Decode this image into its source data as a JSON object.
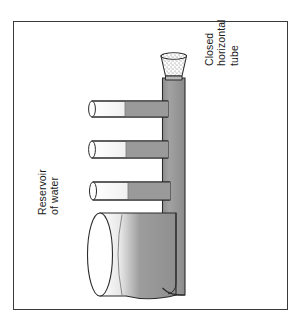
{
  "figure": {
    "kind": "physics-apparatus-diagram",
    "title_alt": "Closed horizontal tube connected to a reservoir of water",
    "frame": {
      "border_color": "#3a3a3a",
      "background": "#ffffff"
    }
  },
  "colors": {
    "water_fill": "#9a9a9a",
    "water_fill_dark": "#8c8c8c",
    "air_fill": "#ffffff",
    "outline": "#2b2b2b",
    "text": "#1a1a1a",
    "stipple": "#6e6e6e",
    "page_background": "#ffffff"
  },
  "labels": {
    "closed_tube": {
      "name": "closed-horizontal-tube-label",
      "lines": [
        "Closed",
        "horizontal",
        "tube"
      ],
      "line1": "Closed",
      "line2": "horizontal",
      "line3": "tube",
      "rotation_deg": -90
    },
    "reservoir": {
      "name": "reservoir-of-water-label",
      "lines": [
        "Reservoir",
        "of  water"
      ],
      "line1": "Reservoir",
      "line2": "of  water",
      "rotation_deg": -90
    }
  },
  "parts": {
    "funnel": {
      "name": "stippled-funnel",
      "description": "stippled trapezoidal funnel at top of vertical tube, wider at top"
    },
    "vertical_tube": {
      "name": "main-vertical-tube",
      "description": "water filled vertical column running down the right side"
    },
    "branch_tubes": [
      {
        "name": "branch-tube-1",
        "description": "upper horizontal tube, air at open left end, water at right"
      },
      {
        "name": "branch-tube-2",
        "description": "middle horizontal tube, air at open left end, water at right"
      },
      {
        "name": "branch-tube-3",
        "description": "lower horizontal tube, air at open left end, water at right"
      }
    ],
    "reservoir": {
      "name": "reservoir-cylinder",
      "description": "large horizontal cylinder of water with elliptical open left end"
    }
  }
}
